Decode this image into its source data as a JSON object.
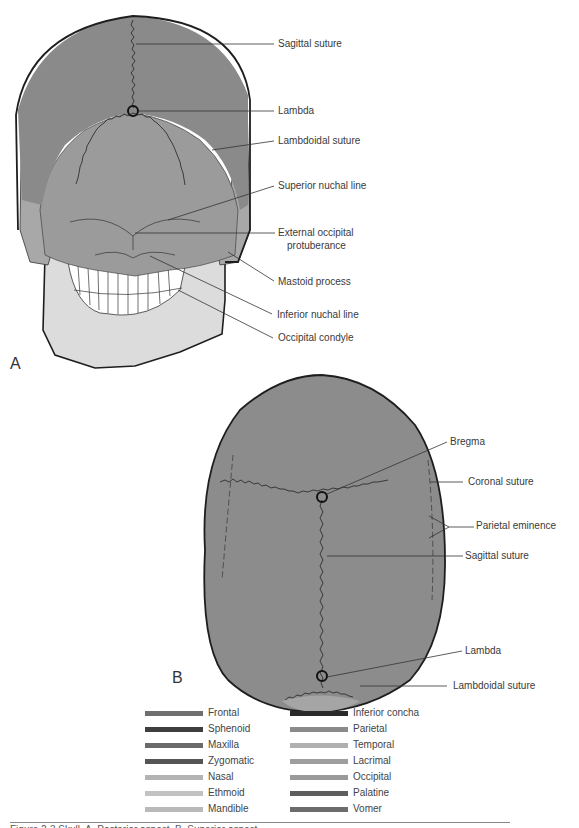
{
  "figure": {
    "panel_a": {
      "letter": "A",
      "view": "posterior skull",
      "labels": [
        "Sagittal suture",
        "Lambda",
        "Lambdoidal suture",
        "Superior nuchal line",
        "External occipital",
        "protuberance",
        "Mastoid process",
        "Inferior nuchal line",
        "Occipital condyle"
      ]
    },
    "panel_b": {
      "letter": "B",
      "view": "superior skull",
      "labels": [
        "Bregma",
        "Coronal suture",
        "Parietal eminence",
        "Sagittal suture",
        "Lambda",
        "Lambdoidal suture"
      ]
    },
    "legend": {
      "left": [
        {
          "label": "Frontal",
          "color": "#6f6f6f"
        },
        {
          "label": "Sphenoid",
          "color": "#3e3e3e"
        },
        {
          "label": "Maxilla",
          "color": "#6a6a6a"
        },
        {
          "label": "Zygomatic",
          "color": "#555555"
        },
        {
          "label": "Nasal",
          "color": "#b3b3b3"
        },
        {
          "label": "Ethmoid",
          "color": "#c2c2c2"
        },
        {
          "label": "Mandible",
          "color": "#b9b9b9"
        }
      ],
      "right": [
        {
          "label": "Inferior concha",
          "color": "#2a2a2a"
        },
        {
          "label": "Parietal",
          "color": "#8a8a8a"
        },
        {
          "label": "Temporal",
          "color": "#b0b0b0"
        },
        {
          "label": "Lacrimal",
          "color": "#9e9e9e"
        },
        {
          "label": "Occipital",
          "color": "#9a9a9a"
        },
        {
          "label": "Palatine",
          "color": "#5e5e5e"
        },
        {
          "label": "Vomer",
          "color": "#6c6c6c"
        }
      ]
    },
    "caption": "Figure 2-3  Skull. A, Posterior aspect. B, Superior aspect."
  },
  "colors": {
    "parietal_fill": "#8c8c8c",
    "occipital_fill": "#999999",
    "temporal_fill": "#b5b5b5",
    "mandible_fill": "#dedede",
    "outline": "#1e1e1e"
  }
}
